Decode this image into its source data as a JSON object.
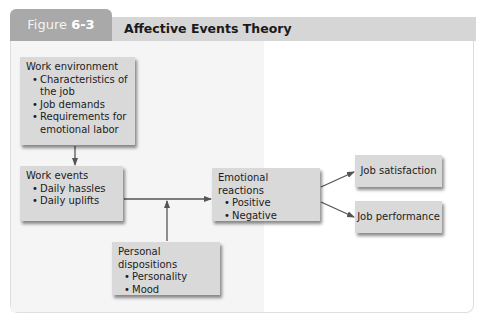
{
  "figure": {
    "label_prefix": "Figure",
    "label_number": "6-3",
    "title": "Affective Events Theory"
  },
  "colors": {
    "tab_bg": "#a9a9a9",
    "header_bg": "#d6d6d6",
    "box_bg": "#d9d9d9",
    "arrow": "#555555"
  },
  "nodes": {
    "work_environment": {
      "title": "Work environment",
      "items": [
        "Characteristics of the job",
        "Job demands",
        "Requirements for emotional labor"
      ]
    },
    "work_events": {
      "title": "Work events",
      "items": [
        "Daily hassles",
        "Daily uplifts"
      ]
    },
    "emotional_reactions": {
      "title": "Emotional reactions",
      "items": [
        "Positive",
        "Negative"
      ]
    },
    "personal_dispositions": {
      "title": "Personal dispositions",
      "items": [
        "Personality",
        "Mood"
      ]
    },
    "job_satisfaction": {
      "title": "Job satisfaction"
    },
    "job_performance": {
      "title": "Job performance"
    }
  },
  "edges": [
    {
      "from": "Work environment",
      "to": "Work events"
    },
    {
      "from": "Work events",
      "to": "Emotional reactions"
    },
    {
      "from": "Personal dispositions",
      "to": "Work events → Emotional reactions link"
    },
    {
      "from": "Emotional reactions",
      "to": "Job satisfaction"
    },
    {
      "from": "Emotional reactions",
      "to": "Job performance"
    }
  ]
}
